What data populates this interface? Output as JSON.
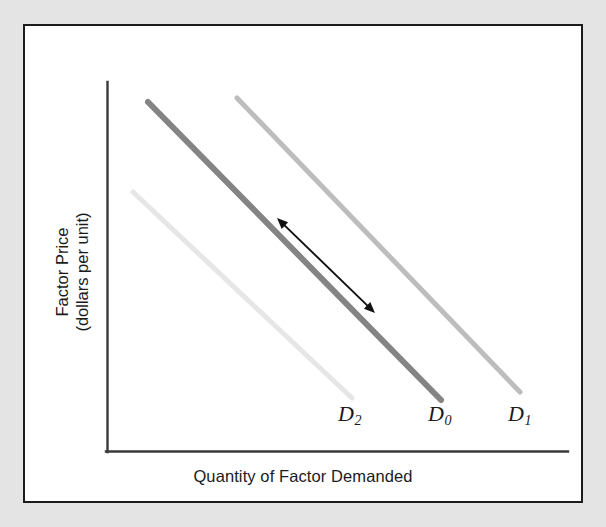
{
  "figure": {
    "background_color": "#e4e4e4",
    "panel_color": "#ffffff",
    "panel_border_color": "#1c1c1c",
    "axis_color": "#3a3a3a"
  },
  "axes": {
    "y_label_line1": "Factor Price",
    "y_label_line2": "(dollars per unit)",
    "x_label": "Quantity of Factor Demanded"
  },
  "labels": {
    "d2_letter": "D",
    "d2_sub": "2",
    "d0_letter": "D",
    "d0_sub": "0",
    "d1_letter": "D",
    "d1_sub": "1"
  },
  "annotation": {
    "arrow_name": "double-headed-shift-arrow",
    "arrow_color": "#111111"
  },
  "chart_data": {
    "type": "line",
    "title": "",
    "xlabel": "Quantity of Factor Demanded",
    "ylabel": "Factor Price (dollars per unit)",
    "grid": false,
    "legend": "inline-curve-labels",
    "axis_ticks": [],
    "xlim": [
      0,
      100
    ],
    "ylim": [
      0,
      100
    ],
    "series": [
      {
        "name": "D2",
        "label": "D₂",
        "color": "#e6e6e6",
        "width": 5,
        "description": "leftward (decreased) factor demand curve",
        "x": [
          5.6,
          52.8
        ],
        "y": [
          75.5,
          18.2
        ],
        "pixel_start": [
          133,
          192
        ],
        "pixel_end": [
          352,
          398
        ]
      },
      {
        "name": "D0",
        "label": "D₀",
        "color": "#848484",
        "width": 6,
        "description": "original factor demand curve",
        "x": [
          8.9,
          72.3
        ],
        "y": [
          100.0,
          17.7
        ],
        "pixel_start": [
          148,
          102
        ],
        "pixel_end": [
          441,
          400
        ]
      },
      {
        "name": "D1",
        "label": "D₁",
        "color": "#bdbdbd",
        "width": 5,
        "description": "rightward (increased) factor demand curve",
        "x": [
          28.2,
          89.4
        ],
        "y": [
          101.1,
          19.5
        ],
        "pixel_start": [
          237,
          98
        ],
        "pixel_end": [
          520,
          392
        ]
      }
    ],
    "annotations": [
      {
        "type": "double-arrow",
        "description": "movement along the D0 curve",
        "pixel_start": [
          277,
          218
        ],
        "pixel_end": [
          375,
          313
        ]
      }
    ]
  }
}
